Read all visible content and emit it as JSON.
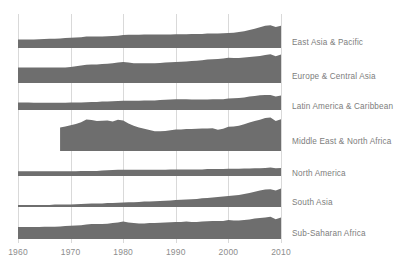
{
  "chart_data": {
    "type": "area",
    "title": "",
    "subtitle": "",
    "xlabel": "",
    "ylabel": "",
    "grid": true,
    "legend_position": "right",
    "layout": "small-multiples-horizon",
    "fill_color": "#6e6e6e",
    "grid_color": "#d9d9d9",
    "tick_label_color": "#8d8d8d",
    "series_label_color": "#7d7d7d",
    "xlim": [
      1960,
      2010
    ],
    "x_ticks": [
      1960,
      1970,
      1980,
      1990,
      2000,
      2010
    ],
    "x_tick_labels": [
      "1960",
      "1970",
      "1980",
      "1990",
      "2000",
      "2010"
    ],
    "x": [
      1960,
      1961,
      1962,
      1963,
      1964,
      1965,
      1966,
      1967,
      1968,
      1969,
      1970,
      1971,
      1972,
      1973,
      1974,
      1975,
      1976,
      1977,
      1978,
      1979,
      1980,
      1981,
      1982,
      1983,
      1984,
      1985,
      1986,
      1987,
      1988,
      1989,
      1990,
      1991,
      1992,
      1993,
      1994,
      1995,
      1996,
      1997,
      1998,
      1999,
      2000,
      2001,
      2002,
      2003,
      2004,
      2005,
      2006,
      2007,
      2008,
      2009,
      2010
    ],
    "series": [
      {
        "name": "East Asia & Pacific",
        "start_year": 1960,
        "values": [
          0.28,
          0.28,
          0.28,
          0.28,
          0.29,
          0.3,
          0.31,
          0.31,
          0.32,
          0.33,
          0.34,
          0.35,
          0.36,
          0.38,
          0.38,
          0.38,
          0.38,
          0.39,
          0.4,
          0.41,
          0.43,
          0.44,
          0.44,
          0.44,
          0.45,
          0.45,
          0.45,
          0.45,
          0.45,
          0.45,
          0.46,
          0.46,
          0.46,
          0.47,
          0.47,
          0.47,
          0.48,
          0.48,
          0.48,
          0.49,
          0.5,
          0.51,
          0.53,
          0.56,
          0.6,
          0.64,
          0.69,
          0.74,
          0.76,
          0.7,
          0.74
        ]
      },
      {
        "name": "Europe & Central Asia",
        "start_year": 1960,
        "values": [
          0.52,
          0.52,
          0.52,
          0.52,
          0.52,
          0.52,
          0.52,
          0.52,
          0.52,
          0.52,
          0.53,
          0.56,
          0.58,
          0.61,
          0.62,
          0.62,
          0.63,
          0.64,
          0.66,
          0.68,
          0.7,
          0.68,
          0.66,
          0.66,
          0.66,
          0.66,
          0.66,
          0.67,
          0.68,
          0.69,
          0.7,
          0.71,
          0.72,
          0.73,
          0.74,
          0.76,
          0.78,
          0.79,
          0.8,
          0.82,
          0.84,
          0.83,
          0.83,
          0.85,
          0.87,
          0.88,
          0.9,
          0.93,
          0.96,
          0.89,
          0.95
        ]
      },
      {
        "name": "Latin America & Caribbean",
        "start_year": 1960,
        "values": [
          0.25,
          0.25,
          0.25,
          0.24,
          0.24,
          0.24,
          0.24,
          0.24,
          0.24,
          0.24,
          0.25,
          0.25,
          0.25,
          0.26,
          0.27,
          0.27,
          0.28,
          0.28,
          0.29,
          0.3,
          0.31,
          0.31,
          0.31,
          0.31,
          0.32,
          0.32,
          0.32,
          0.33,
          0.34,
          0.35,
          0.36,
          0.36,
          0.36,
          0.35,
          0.35,
          0.35,
          0.35,
          0.36,
          0.36,
          0.36,
          0.38,
          0.39,
          0.4,
          0.42,
          0.45,
          0.47,
          0.49,
          0.5,
          0.5,
          0.45,
          0.48
        ]
      },
      {
        "name": "Middle East & North Africa",
        "start_year": 1968,
        "values": [
          null,
          null,
          null,
          null,
          null,
          null,
          null,
          null,
          0.78,
          0.82,
          0.86,
          0.9,
          0.96,
          1.05,
          1.03,
          1.0,
          1.01,
          1.02,
          0.98,
          1.04,
          1.02,
          0.92,
          0.84,
          0.78,
          0.74,
          0.7,
          0.66,
          0.66,
          0.67,
          0.69,
          0.72,
          0.72,
          0.73,
          0.73,
          0.74,
          0.75,
          0.75,
          0.76,
          0.71,
          0.74,
          0.81,
          0.82,
          0.84,
          0.89,
          0.95,
          1.0,
          1.04,
          1.1,
          1.12,
          1.0,
          1.06
        ]
      },
      {
        "name": "North America",
        "start_year": 1960,
        "values": [
          0.16,
          0.16,
          0.16,
          0.16,
          0.16,
          0.16,
          0.16,
          0.16,
          0.16,
          0.16,
          0.16,
          0.16,
          0.17,
          0.17,
          0.17,
          0.17,
          0.18,
          0.19,
          0.2,
          0.21,
          0.21,
          0.21,
          0.21,
          0.21,
          0.21,
          0.21,
          0.21,
          0.21,
          0.21,
          0.22,
          0.22,
          0.22,
          0.22,
          0.22,
          0.22,
          0.22,
          0.23,
          0.23,
          0.23,
          0.23,
          0.24,
          0.24,
          0.24,
          0.25,
          0.25,
          0.26,
          0.26,
          0.27,
          0.28,
          0.26,
          0.27
        ]
      },
      {
        "name": "South Asia",
        "start_year": 1960,
        "values": [
          0.07,
          0.07,
          0.07,
          0.07,
          0.07,
          0.07,
          0.07,
          0.08,
          0.08,
          0.08,
          0.08,
          0.09,
          0.1,
          0.11,
          0.12,
          0.12,
          0.12,
          0.13,
          0.13,
          0.14,
          0.15,
          0.16,
          0.16,
          0.17,
          0.18,
          0.18,
          0.19,
          0.2,
          0.21,
          0.22,
          0.23,
          0.24,
          0.25,
          0.26,
          0.27,
          0.29,
          0.3,
          0.32,
          0.33,
          0.35,
          0.37,
          0.38,
          0.4,
          0.43,
          0.47,
          0.51,
          0.55,
          0.58,
          0.59,
          0.55,
          0.62
        ]
      },
      {
        "name": "Sub-Saharan Africa",
        "start_year": 1960,
        "values": [
          0.4,
          0.4,
          0.4,
          0.4,
          0.4,
          0.41,
          0.41,
          0.41,
          0.42,
          0.43,
          0.44,
          0.45,
          0.46,
          0.48,
          0.5,
          0.5,
          0.5,
          0.51,
          0.53,
          0.55,
          0.58,
          0.55,
          0.53,
          0.52,
          0.52,
          0.53,
          0.53,
          0.54,
          0.55,
          0.56,
          0.57,
          0.57,
          0.58,
          0.57,
          0.57,
          0.58,
          0.59,
          0.6,
          0.6,
          0.6,
          0.63,
          0.62,
          0.62,
          0.63,
          0.65,
          0.68,
          0.7,
          0.72,
          0.74,
          0.66,
          0.72
        ]
      }
    ]
  },
  "axis": {
    "tick_labels": [
      "1960",
      "1970",
      "1980",
      "1990",
      "2000",
      "2010"
    ]
  },
  "labels": {
    "east_asia": "East Asia & Pacific",
    "europe": "Europe & Central Asia",
    "latin_america": "Latin America & Caribbean",
    "middle_east": "Middle East & North Africa",
    "north_america": "North America",
    "south_asia": "South Asia",
    "sub_saharan": "Sub-Saharan Africa"
  }
}
